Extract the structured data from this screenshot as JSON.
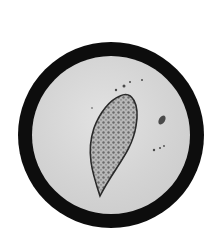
{
  "image": {
    "description": "Micrograph in a circular microscope field showing a spindle-shaped egg with a lateral spine and granular interior",
    "colors": {
      "background": "#ffffff",
      "field_ring": "#0d0d0d",
      "field_fill": "#d6d6d6",
      "egg_outline": "#2a2a2a"
    }
  }
}
